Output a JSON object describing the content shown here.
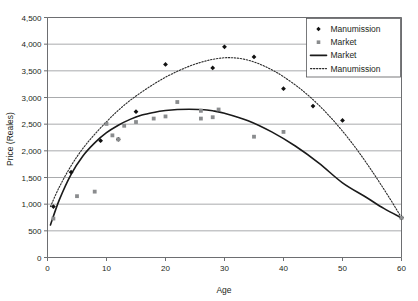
{
  "chart_data": {
    "type": "scatter",
    "title": "",
    "xlabel": "Age",
    "ylabel": "Price (Reales)",
    "xlim": [
      0,
      60
    ],
    "ylim": [
      0,
      4500
    ],
    "xticks": [
      0,
      10,
      20,
      30,
      40,
      50,
      60
    ],
    "xtick_labels": [
      "0",
      "10",
      "20",
      "30",
      "40",
      "50",
      "60"
    ],
    "yticks": [
      0,
      500,
      1000,
      1500,
      2000,
      2500,
      3000,
      3500,
      4000,
      4500
    ],
    "ytick_labels": [
      "0",
      "500",
      "1,000",
      "1,500",
      "2,000",
      "2,500",
      "3,000",
      "3,500",
      "4,000",
      "4,500"
    ],
    "grid": "horizontal",
    "legend_position": "top-right",
    "colors": {
      "manumission_point": "#111111",
      "market_point": "#8a8c8e",
      "market_line": "#1a1a1a",
      "manumission_line": "#2b2b2b",
      "grid": "#939598",
      "axis": "#6d6e71"
    },
    "series": [
      {
        "name": "Manumission",
        "kind": "scatter",
        "marker": "diamond",
        "points": [
          {
            "x": 1,
            "y": 955
          },
          {
            "x": 4,
            "y": 1600
          },
          {
            "x": 9,
            "y": 2190
          },
          {
            "x": 12,
            "y": 2215
          },
          {
            "x": 15,
            "y": 2735
          },
          {
            "x": 20,
            "y": 3620
          },
          {
            "x": 28,
            "y": 3555
          },
          {
            "x": 30,
            "y": 3950
          },
          {
            "x": 35,
            "y": 3760
          },
          {
            "x": 40,
            "y": 3165
          },
          {
            "x": 45,
            "y": 2840
          },
          {
            "x": 50,
            "y": 2570
          },
          {
            "x": 60,
            "y": 745
          }
        ]
      },
      {
        "name": "Market",
        "kind": "scatter",
        "marker": "square",
        "points": [
          {
            "x": 1,
            "y": 730
          },
          {
            "x": 5,
            "y": 1150
          },
          {
            "x": 8,
            "y": 1235
          },
          {
            "x": 10,
            "y": 2505
          },
          {
            "x": 11,
            "y": 2290
          },
          {
            "x": 12,
            "y": 2215
          },
          {
            "x": 13,
            "y": 2470
          },
          {
            "x": 15,
            "y": 2540
          },
          {
            "x": 18,
            "y": 2605
          },
          {
            "x": 20,
            "y": 2645
          },
          {
            "x": 22,
            "y": 2915
          },
          {
            "x": 26,
            "y": 2750
          },
          {
            "x": 26,
            "y": 2605
          },
          {
            "x": 28,
            "y": 2630
          },
          {
            "x": 29,
            "y": 2775
          },
          {
            "x": 35,
            "y": 2265
          },
          {
            "x": 40,
            "y": 2355
          },
          {
            "x": 60,
            "y": 745
          }
        ]
      },
      {
        "name": "Market",
        "kind": "fit-line",
        "style": "solid",
        "points": [
          {
            "x": 0.5,
            "y": 610
          },
          {
            "x": 2,
            "y": 1080
          },
          {
            "x": 4,
            "y": 1560
          },
          {
            "x": 6,
            "y": 1905
          },
          {
            "x": 8,
            "y": 2150
          },
          {
            "x": 10,
            "y": 2340
          },
          {
            "x": 12,
            "y": 2480
          },
          {
            "x": 14,
            "y": 2590
          },
          {
            "x": 16,
            "y": 2670
          },
          {
            "x": 18,
            "y": 2720
          },
          {
            "x": 20,
            "y": 2755
          },
          {
            "x": 22,
            "y": 2775
          },
          {
            "x": 24,
            "y": 2780
          },
          {
            "x": 26,
            "y": 2775
          },
          {
            "x": 28,
            "y": 2750
          },
          {
            "x": 30,
            "y": 2705
          },
          {
            "x": 34,
            "y": 2565
          },
          {
            "x": 38,
            "y": 2355
          },
          {
            "x": 42,
            "y": 2090
          },
          {
            "x": 46,
            "y": 1770
          },
          {
            "x": 50,
            "y": 1400
          },
          {
            "x": 54,
            "y": 1130
          },
          {
            "x": 57,
            "y": 920
          },
          {
            "x": 60,
            "y": 745
          }
        ]
      },
      {
        "name": "Manumission",
        "kind": "fit-line",
        "style": "dotted",
        "points": [
          {
            "x": 0.5,
            "y": 955
          },
          {
            "x": 2,
            "y": 1320
          },
          {
            "x": 4,
            "y": 1720
          },
          {
            "x": 6,
            "y": 2045
          },
          {
            "x": 8,
            "y": 2310
          },
          {
            "x": 10,
            "y": 2545
          },
          {
            "x": 12,
            "y": 2760
          },
          {
            "x": 14,
            "y": 2945
          },
          {
            "x": 16,
            "y": 3105
          },
          {
            "x": 18,
            "y": 3250
          },
          {
            "x": 20,
            "y": 3380
          },
          {
            "x": 22,
            "y": 3490
          },
          {
            "x": 24,
            "y": 3585
          },
          {
            "x": 26,
            "y": 3660
          },
          {
            "x": 28,
            "y": 3715
          },
          {
            "x": 30,
            "y": 3745
          },
          {
            "x": 32,
            "y": 3740
          },
          {
            "x": 34,
            "y": 3700
          },
          {
            "x": 36,
            "y": 3625
          },
          {
            "x": 38,
            "y": 3520
          },
          {
            "x": 40,
            "y": 3390
          },
          {
            "x": 43,
            "y": 3150
          },
          {
            "x": 46,
            "y": 2855
          },
          {
            "x": 49,
            "y": 2500
          },
          {
            "x": 52,
            "y": 2090
          },
          {
            "x": 55,
            "y": 1620
          },
          {
            "x": 58,
            "y": 1110
          },
          {
            "x": 60,
            "y": 745
          }
        ]
      }
    ],
    "legend": [
      {
        "label": "Manumission",
        "marker": "diamond",
        "type": "point"
      },
      {
        "label": "Market",
        "marker": "square",
        "type": "point"
      },
      {
        "label": "Market",
        "marker": "solid-line",
        "type": "line"
      },
      {
        "label": "Manumission",
        "marker": "dotted-line",
        "type": "line"
      }
    ]
  }
}
